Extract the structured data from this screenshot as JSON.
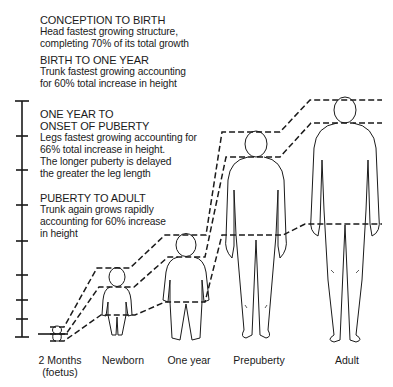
{
  "sections": [
    {
      "title": "CONCEPTION TO BIRTH",
      "lines": [
        "Head fastest growing structure,",
        "completing 70% of its total growth"
      ]
    },
    {
      "title": "BIRTH TO ONE YEAR",
      "lines": [
        "Trunk fastest growing accounting",
        "for 60% total increase in height"
      ]
    },
    {
      "title_lines": [
        "ONE YEAR TO",
        "ONSET OF PUBERTY"
      ],
      "lines": [
        "Legs fastest growing accounting for",
        "66% total increase in height.",
        "The longer puberty is delayed",
        "the greater the leg length"
      ]
    },
    {
      "title": "PUBERTY TO ADULT",
      "lines": [
        "Trunk again grows rapidly",
        "accounting for 60% increase",
        "in height"
      ]
    }
  ],
  "stages": [
    {
      "label": "2 Months",
      "sublabel": "(foetus)"
    },
    {
      "label": "Newborn"
    },
    {
      "label": "One year"
    },
    {
      "label": "Prepuberty"
    },
    {
      "label": "Adult"
    }
  ],
  "scale": {
    "ticks": 9
  },
  "colors": {
    "ink": "#1a1a1a",
    "background": "#ffffff"
  }
}
